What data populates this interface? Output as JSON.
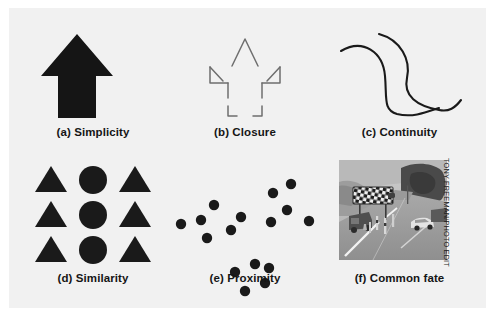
{
  "figure": {
    "background_color": "#f1f1f1",
    "page_color": "#ffffff",
    "ink_color": "#1a1a1a",
    "outline_color": "#6e6e6e"
  },
  "panels": [
    {
      "id": "a",
      "caption": "(a) Simplicity",
      "illustration": "solid-black-up-arrow"
    },
    {
      "id": "b",
      "caption": "(b) Closure",
      "illustration": "outlined-up-arrow-with-gaps"
    },
    {
      "id": "c",
      "caption": "(c) Continuity",
      "illustration": "two-crossing-curved-lines"
    },
    {
      "id": "d",
      "caption": "(d) Similarity",
      "illustration": "grid-of-triangles-and-circles"
    },
    {
      "id": "e",
      "caption": "(e) Proximity",
      "illustration": "three-clusters-of-dots"
    },
    {
      "id": "f",
      "caption": "(f) Common fate",
      "illustration": "photograph-of-road-construction-scene",
      "credit": "TONY FREEMAN/PHOTO EDIT"
    }
  ],
  "similarity_grid": {
    "rows": 3,
    "columns": 3,
    "column_shapes": [
      "triangle",
      "circle",
      "triangle"
    ]
  },
  "proximity_clusters": [
    {
      "name": "left-cluster",
      "count": 6,
      "dots": [
        [
          12,
          64
        ],
        [
          32,
          60
        ],
        [
          45,
          45
        ],
        [
          38,
          78
        ],
        [
          62,
          70
        ],
        [
          72,
          57
        ]
      ]
    },
    {
      "name": "upper-right-cluster",
      "count": 5,
      "dots": [
        [
          104,
          33
        ],
        [
          122,
          24
        ],
        [
          118,
          50
        ],
        [
          102,
          62
        ],
        [
          140,
          61
        ]
      ]
    },
    {
      "name": "bottom-cluster",
      "count": 5,
      "dots": [
        [
          66,
          112
        ],
        [
          86,
          104
        ],
        [
          100,
          108
        ],
        [
          96,
          123
        ],
        [
          76,
          131
        ]
      ]
    }
  ]
}
